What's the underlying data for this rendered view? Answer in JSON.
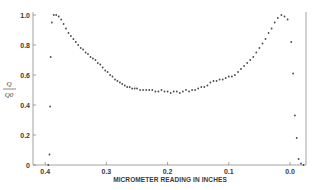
{
  "chart_data": {
    "type": "scatter",
    "title": "",
    "xlabel": "MICROMETER READING IN INCHES",
    "ylabel": "Q / Q0",
    "ylabel_numerator": "Q",
    "ylabel_denominator": "Q0",
    "x_reversed": true,
    "xlim": [
      0.42,
      -0.03
    ],
    "ylim": [
      0,
      1.0
    ],
    "grid": false,
    "legend": null,
    "x_ticks": [
      0.4,
      0.3,
      0.2,
      0.1,
      0.0
    ],
    "x_tick_labels": [
      "0.4",
      "0.3",
      "0.2",
      "0.1",
      "0.0"
    ],
    "y_ticks": [
      0,
      0.2,
      0.4,
      0.6,
      0.8,
      1.0
    ],
    "y_tick_labels": [
      "0",
      "0.2",
      "0.4",
      "0.6",
      "0.8",
      "1.0"
    ],
    "series": [
      {
        "name": "Q/Q0",
        "points": [
          [
            0.395,
            0.0
          ],
          [
            0.393,
            0.07
          ],
          [
            0.392,
            0.39
          ],
          [
            0.391,
            0.72
          ],
          [
            0.389,
            0.95
          ],
          [
            0.386,
            1.0
          ],
          [
            0.382,
            1.0
          ],
          [
            0.378,
            0.99
          ],
          [
            0.374,
            0.97
          ],
          [
            0.37,
            0.94
          ],
          [
            0.366,
            0.91
          ],
          [
            0.362,
            0.88
          ],
          [
            0.358,
            0.86
          ],
          [
            0.354,
            0.84
          ],
          [
            0.35,
            0.82
          ],
          [
            0.346,
            0.8
          ],
          [
            0.342,
            0.78
          ],
          [
            0.338,
            0.77
          ],
          [
            0.334,
            0.75
          ],
          [
            0.33,
            0.74
          ],
          [
            0.326,
            0.72
          ],
          [
            0.322,
            0.71
          ],
          [
            0.318,
            0.7
          ],
          [
            0.314,
            0.68
          ],
          [
            0.31,
            0.67
          ],
          [
            0.306,
            0.65
          ],
          [
            0.302,
            0.63
          ],
          [
            0.298,
            0.62
          ],
          [
            0.294,
            0.6
          ],
          [
            0.29,
            0.59
          ],
          [
            0.286,
            0.57
          ],
          [
            0.282,
            0.56
          ],
          [
            0.278,
            0.55
          ],
          [
            0.274,
            0.54
          ],
          [
            0.27,
            0.53
          ],
          [
            0.266,
            0.52
          ],
          [
            0.262,
            0.52
          ],
          [
            0.258,
            0.51
          ],
          [
            0.254,
            0.51
          ],
          [
            0.25,
            0.51
          ],
          [
            0.245,
            0.5
          ],
          [
            0.24,
            0.5
          ],
          [
            0.235,
            0.5
          ],
          [
            0.23,
            0.5
          ],
          [
            0.225,
            0.5
          ],
          [
            0.22,
            0.49
          ],
          [
            0.215,
            0.49
          ],
          [
            0.21,
            0.5
          ],
          [
            0.205,
            0.49
          ],
          [
            0.2,
            0.49
          ],
          [
            0.195,
            0.48
          ],
          [
            0.19,
            0.49
          ],
          [
            0.185,
            0.49
          ],
          [
            0.18,
            0.48
          ],
          [
            0.175,
            0.49
          ],
          [
            0.17,
            0.5
          ],
          [
            0.165,
            0.49
          ],
          [
            0.16,
            0.5
          ],
          [
            0.155,
            0.5
          ],
          [
            0.15,
            0.51
          ],
          [
            0.145,
            0.52
          ],
          [
            0.14,
            0.52
          ],
          [
            0.135,
            0.53
          ],
          [
            0.13,
            0.55
          ],
          [
            0.125,
            0.56
          ],
          [
            0.12,
            0.56
          ],
          [
            0.115,
            0.57
          ],
          [
            0.11,
            0.57
          ],
          [
            0.105,
            0.58
          ],
          [
            0.1,
            0.59
          ],
          [
            0.095,
            0.59
          ],
          [
            0.09,
            0.6
          ],
          [
            0.085,
            0.62
          ],
          [
            0.08,
            0.64
          ],
          [
            0.075,
            0.66
          ],
          [
            0.07,
            0.68
          ],
          [
            0.065,
            0.7
          ],
          [
            0.06,
            0.72
          ],
          [
            0.055,
            0.75
          ],
          [
            0.05,
            0.78
          ],
          [
            0.045,
            0.81
          ],
          [
            0.04,
            0.84
          ],
          [
            0.035,
            0.88
          ],
          [
            0.03,
            0.91
          ],
          [
            0.025,
            0.95
          ],
          [
            0.02,
            0.98
          ],
          [
            0.014,
            1.0
          ],
          [
            0.009,
            0.99
          ],
          [
            0.004,
            0.97
          ],
          [
            -0.002,
            0.82
          ],
          [
            -0.005,
            0.61
          ],
          [
            -0.008,
            0.33
          ],
          [
            -0.011,
            0.18
          ],
          [
            -0.014,
            0.04
          ],
          [
            -0.018,
            0.01
          ],
          [
            -0.022,
            0.0
          ]
        ]
      }
    ]
  }
}
